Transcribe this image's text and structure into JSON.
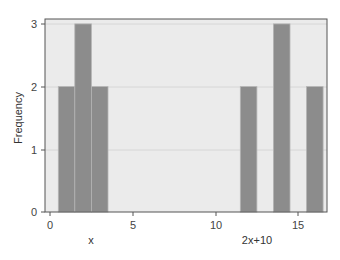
{
  "chart_data": {
    "type": "bar",
    "title": "",
    "xlabel": "",
    "ylabel": "Frequency",
    "annotations": [
      "x",
      "2x+10"
    ],
    "xlim": [
      -0.3,
      16.8
    ],
    "ylim": [
      0,
      3.1
    ],
    "xticks": [
      0,
      5,
      10,
      15
    ],
    "yticks": [
      0,
      1,
      2,
      3
    ],
    "grid": true,
    "legend": null,
    "series": [
      {
        "name": "x",
        "x": [
          1,
          2,
          3
        ],
        "values": [
          2,
          3,
          2
        ],
        "bar_width": 1
      },
      {
        "name": "2x+10",
        "x": [
          12,
          14,
          16
        ],
        "values": [
          2,
          3,
          2
        ],
        "bar_width": 1
      }
    ],
    "colors": {
      "bar": "#8c8c8c",
      "plot_background": "#ebebeb",
      "axis": "#555555"
    }
  },
  "labels": {
    "ylabel": "Frequency",
    "group_x": "x",
    "group_2x10": "2x+10",
    "xtick_0": "0",
    "xtick_5": "5",
    "xtick_10": "10",
    "xtick_15": "15",
    "ytick_0": "0",
    "ytick_1": "1",
    "ytick_2": "2",
    "ytick_3": "3"
  }
}
